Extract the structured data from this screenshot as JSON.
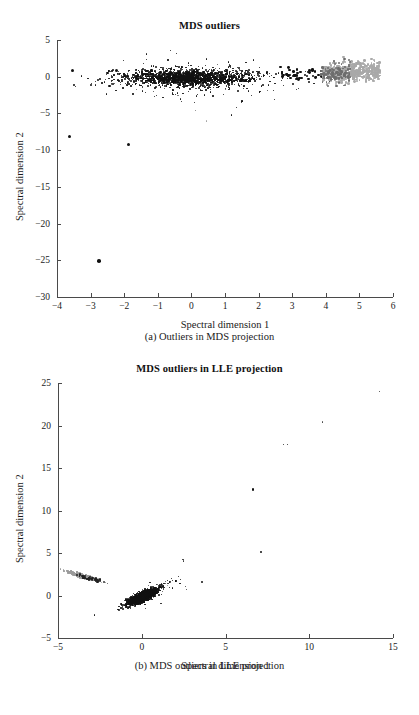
{
  "figure": {
    "panels": [
      "a",
      "b"
    ]
  },
  "chart_data": [
    {
      "id": "mds-outliers",
      "type": "scatter",
      "title": "MDS outliers",
      "caption": "(a) Outliers in MDS projection",
      "xlabel": "Spectral dimension 1",
      "ylabel": "Spectral dimension 2",
      "xlim": [
        -4,
        6
      ],
      "ylim": [
        -30,
        5
      ],
      "xticks": [
        -4,
        -3,
        -2,
        -1,
        0,
        1,
        2,
        3,
        4,
        5,
        6
      ],
      "xticklabels": [
        "−4",
        "−3",
        "−2",
        "−1",
        "0",
        "1",
        "2",
        "3",
        "4",
        "5",
        "6"
      ],
      "yticks": [
        5,
        0,
        -5,
        -10,
        -15,
        -20,
        -25,
        -30
      ],
      "yticklabels": [
        "5",
        "0",
        "−5",
        "−10",
        "−15",
        "−20",
        "−25",
        "−30"
      ],
      "grid": false,
      "legend": "none",
      "plot_rect": {
        "left": 57,
        "top": 40,
        "width": 336,
        "height": 257
      },
      "series": [
        {
          "name": "inliers-main-cluster",
          "color": "#111111",
          "marker": "dot",
          "cloud": {
            "kind": "gaussian-band",
            "n": 1500,
            "x_center": -0.05,
            "x_spread": 0.95,
            "y_center": -0.15,
            "y_spread": 0.55,
            "size_min": 1.1,
            "size_max": 2.1,
            "seed": 17
          }
        },
        {
          "name": "inliers-fringe",
          "color": "#111111",
          "marker": "dot",
          "cloud": {
            "kind": "gaussian-band",
            "n": 260,
            "x_center": 0.35,
            "x_spread": 1.5,
            "y_center": -0.5,
            "y_spread": 1.15,
            "size_min": 0.9,
            "size_max": 1.7,
            "seed": 41
          }
        },
        {
          "name": "outlier-arm-black",
          "color": "#111111",
          "marker": "dot",
          "cloud": {
            "kind": "uniform-band",
            "n": 46,
            "x_min": 2.65,
            "x_max": 4.15,
            "y_center": 0.35,
            "y_spread": 0.5,
            "size_min": 2.0,
            "size_max": 3.0,
            "seed": 73
          }
        },
        {
          "name": "outlier-arm-gray",
          "color": "#a9a9a9",
          "marker": "dot",
          "cloud": {
            "kind": "uniform-band",
            "n": 520,
            "x_min": 3.9,
            "x_max": 5.62,
            "y_center": 0.65,
            "y_spread": 0.62,
            "size_min": 1.6,
            "size_max": 2.8,
            "seed": 95
          }
        },
        {
          "name": "outlier-arm-darkgray",
          "color": "#6d6d6d",
          "marker": "dot",
          "cloud": {
            "kind": "uniform-band",
            "n": 120,
            "x_min": 3.85,
            "x_max": 4.75,
            "y_center": 0.5,
            "y_spread": 0.6,
            "size_min": 1.6,
            "size_max": 2.6,
            "seed": 123
          }
        }
      ],
      "labeled_outliers": [
        {
          "x": -3.55,
          "y": 0.9,
          "color": "#111111",
          "size": 3.0
        },
        {
          "x": -3.62,
          "y": -8.2,
          "color": "#111111",
          "size": 3.0
        },
        {
          "x": -2.75,
          "y": -25.1,
          "color": "#111111",
          "size": 3.6
        },
        {
          "x": -1.88,
          "y": -9.2,
          "color": "#111111",
          "size": 3.2
        },
        {
          "x": -2.24,
          "y": 0.85,
          "color": "#111111",
          "size": 3.2
        },
        {
          "x": -0.62,
          "y": 3.6,
          "color": "#111111",
          "size": 1.4
        },
        {
          "x": -0.45,
          "y": 3.15,
          "color": "#111111",
          "size": 1.3
        },
        {
          "x": 0.45,
          "y": 2.4,
          "color": "#111111",
          "size": 1.2
        },
        {
          "x": 1.62,
          "y": 1.95,
          "color": "#111111",
          "size": 1.4
        },
        {
          "x": 1.85,
          "y": 2.25,
          "color": "#111111",
          "size": 1.5
        },
        {
          "x": 1.1,
          "y": 2.0,
          "color": "#111111",
          "size": 1.2
        },
        {
          "x": -0.4,
          "y": -2.6,
          "color": "#777777",
          "size": 1.2
        },
        {
          "x": 0.12,
          "y": -4.6,
          "color": "#777777",
          "size": 1.2
        },
        {
          "x": 0.45,
          "y": -6.0,
          "color": "#a0a0a0",
          "size": 1.6
        },
        {
          "x": 1.2,
          "y": -5.2,
          "color": "#111111",
          "size": 1.4
        },
        {
          "x": 1.35,
          "y": -4.2,
          "color": "#111111",
          "size": 1.3
        },
        {
          "x": 1.5,
          "y": -3.5,
          "color": "#111111",
          "size": 1.4
        },
        {
          "x": 2.05,
          "y": -2.0,
          "color": "#111111",
          "size": 1.6
        },
        {
          "x": 2.3,
          "y": -1.1,
          "color": "#111111",
          "size": 1.5
        },
        {
          "x": 2.45,
          "y": -1.9,
          "color": "#111111",
          "size": 1.3
        }
      ]
    },
    {
      "id": "mds-outliers-lle",
      "type": "scatter",
      "title": "MDS outliers in LLE projection",
      "caption": "(b) MDS outliers in LLE projection",
      "xlabel": "Spectral dimension 1",
      "ylabel": "Spectral dimension 2",
      "xlim": [
        -5,
        15
      ],
      "ylim": [
        -5,
        25
      ],
      "xticks": [
        -5,
        0,
        5,
        10,
        15
      ],
      "xticklabels": [
        "−5",
        "0",
        "5",
        "10",
        "15"
      ],
      "yticks": [
        25,
        20,
        15,
        10,
        5,
        0,
        -5
      ],
      "yticklabels": [
        "25",
        "20",
        "15",
        "10",
        "5",
        "0",
        "−5"
      ],
      "grid": false,
      "legend": "none",
      "plot_rect": {
        "left": 58,
        "top": 28,
        "width": 335,
        "height": 255
      },
      "series": [
        {
          "name": "inliers-main-cluster",
          "color": "#111111",
          "marker": "dot",
          "cloud": {
            "kind": "tilted-gaussian",
            "n": 1700,
            "x_center": 0.05,
            "x_spread": 0.42,
            "y_center": -0.15,
            "y_spread": 0.26,
            "tilt": 0.85,
            "size_min": 1.0,
            "size_max": 2.0,
            "seed": 29
          }
        },
        {
          "name": "inliers-tail",
          "color": "#111111",
          "marker": "dot",
          "cloud": {
            "kind": "tilted-gaussian",
            "n": 170,
            "x_center": 0.45,
            "x_spread": 0.7,
            "y_center": 0.25,
            "y_spread": 0.45,
            "tilt": 0.9,
            "size_min": 0.9,
            "size_max": 1.6,
            "seed": 57
          }
        },
        {
          "name": "outlier-streak-gray",
          "color": "#9a9a9a",
          "marker": "dot",
          "cloud": {
            "kind": "tilted-gaussian",
            "n": 240,
            "x_center": -3.55,
            "x_spread": 0.45,
            "y_center": 2.3,
            "y_spread": 0.12,
            "tilt": -0.55,
            "size_min": 1.2,
            "size_max": 2.2,
            "seed": 88
          }
        },
        {
          "name": "outlier-streak-black",
          "color": "#222222",
          "marker": "dot",
          "cloud": {
            "kind": "tilted-gaussian",
            "n": 36,
            "x_center": -3.1,
            "x_spread": 0.38,
            "y_center": 2.0,
            "y_spread": 0.1,
            "tilt": -0.5,
            "size_min": 1.6,
            "size_max": 2.6,
            "seed": 104
          }
        }
      ],
      "labeled_outliers": [
        {
          "x": 14.2,
          "y": 24.0,
          "color": "#333333",
          "size": 1.3
        },
        {
          "x": 10.8,
          "y": 20.4,
          "color": "#444444",
          "size": 1.3
        },
        {
          "x": 8.45,
          "y": 17.8,
          "color": "#222222",
          "size": 1.4
        },
        {
          "x": 8.7,
          "y": 17.8,
          "color": "#222222",
          "size": 1.4
        },
        {
          "x": 6.65,
          "y": 12.45,
          "color": "#111111",
          "size": 2.6
        },
        {
          "x": 7.1,
          "y": 5.1,
          "color": "#111111",
          "size": 2.2
        },
        {
          "x": 3.6,
          "y": 1.6,
          "color": "#111111",
          "size": 2.6
        },
        {
          "x": 2.45,
          "y": 4.25,
          "color": "#333333",
          "size": 1.5
        },
        {
          "x": 2.5,
          "y": 4.05,
          "color": "#333333",
          "size": 1.5
        },
        {
          "x": 2.62,
          "y": 1.05,
          "color": "#333333",
          "size": 1.3
        },
        {
          "x": 2.68,
          "y": 0.75,
          "color": "#333333",
          "size": 1.2
        },
        {
          "x": 1.7,
          "y": 1.55,
          "color": "#888888",
          "size": 1.3
        },
        {
          "x": 1.55,
          "y": 1.2,
          "color": "#888888",
          "size": 1.2
        },
        {
          "x": -2.25,
          "y": 1.6,
          "color": "#555555",
          "size": 1.3
        },
        {
          "x": -2.05,
          "y": 1.45,
          "color": "#555555",
          "size": 1.2
        },
        {
          "x": -0.9,
          "y": -1.45,
          "color": "#222222",
          "size": 1.3
        },
        {
          "x": 0.2,
          "y": -1.5,
          "color": "#222222",
          "size": 1.2
        },
        {
          "x": 1.15,
          "y": -0.95,
          "color": "#222222",
          "size": 1.3
        }
      ]
    }
  ]
}
